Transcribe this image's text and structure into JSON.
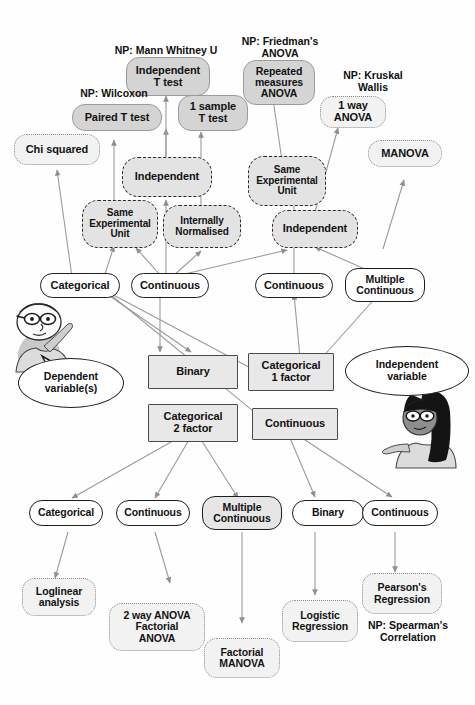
{
  "nodes": {
    "tests_top": [
      {
        "id": "chi-squared",
        "label": "Chi squared"
      },
      {
        "id": "paired-t-test",
        "label": "Paired T test"
      },
      {
        "id": "independent-t-test",
        "label": "Independent\nT test"
      },
      {
        "id": "one-sample-t-test",
        "label": "1 sample\nT test"
      },
      {
        "id": "repeated-measures-anova",
        "label": "Repeated\nmeasures\nANOVA"
      },
      {
        "id": "one-way-anova",
        "label": "1 way\nANOVA"
      },
      {
        "id": "manova",
        "label": "MANOVA"
      }
    ],
    "np_captions": [
      {
        "id": "np-wilcoxon",
        "label": "NP: Wilcoxon"
      },
      {
        "id": "np-mann-whitney",
        "label": "NP: Mann Whitney U"
      },
      {
        "id": "np-friedmans-anova",
        "label": "NP: Friedman's\nANOVA"
      },
      {
        "id": "np-kruskal-wallis",
        "label": "NP: Kruskal\nWallis"
      },
      {
        "id": "np-spearmans-correlation",
        "label": "NP: Spearman's\nCorrelation"
      }
    ],
    "decisions": [
      {
        "id": "decision-independent-left",
        "label": "Independent"
      },
      {
        "id": "decision-same-experimental-unit-left",
        "label": "Same\nExperimental\nUnit"
      },
      {
        "id": "decision-internally-normalised",
        "label": "Internally\nNormalised"
      },
      {
        "id": "decision-same-experimental-unit-right",
        "label": "Same\nExperimental\nUnit"
      },
      {
        "id": "decision-independent-right",
        "label": "Independent"
      }
    ],
    "dependent_row": [
      {
        "id": "dep-categorical",
        "label": "Categorical"
      },
      {
        "id": "dep-continuous-1",
        "label": "Continuous"
      },
      {
        "id": "dep-continuous-2",
        "label": "Continuous"
      },
      {
        "id": "dep-multiple-continuous",
        "label": "Multiple\nContinuous"
      }
    ],
    "independent_boxes": [
      {
        "id": "box-binary",
        "label": "Binary"
      },
      {
        "id": "box-categorical-1-factor",
        "label": "Categorical\n1 factor"
      },
      {
        "id": "box-categorical-2-factor",
        "label": "Categorical\n2 factor"
      },
      {
        "id": "box-continuous",
        "label": "Continuous"
      }
    ],
    "outcome_row": [
      {
        "id": "out-categorical",
        "label": "Categorical"
      },
      {
        "id": "out-continuous-1",
        "label": "Continuous"
      },
      {
        "id": "out-multiple-continuous",
        "label": "Multiple\nContinuous"
      },
      {
        "id": "out-binary",
        "label": "Binary"
      },
      {
        "id": "out-continuous-2",
        "label": "Continuous"
      }
    ],
    "tests_bottom": [
      {
        "id": "loglinear-analysis",
        "label": "Loglinear\nanalysis"
      },
      {
        "id": "two-way-anova",
        "label": "2 way ANOVA\nFactorial\nANOVA"
      },
      {
        "id": "factorial-manova",
        "label": "Factorial\nMANOVA"
      },
      {
        "id": "logistic-regression",
        "label": "Logistic\nRegression"
      },
      {
        "id": "pearsons-regression",
        "label": "Pearson's\nRegression"
      }
    ]
  },
  "bubbles": [
    {
      "id": "bubble-dependent",
      "label": "Dependent\nvariable(s)"
    },
    {
      "id": "bubble-independent",
      "label": "Independent\nvariable"
    }
  ],
  "figures": [
    {
      "id": "figure-man",
      "name": "man-with-glasses"
    },
    {
      "id": "figure-woman",
      "name": "woman-with-long-hair"
    }
  ],
  "colors": {
    "test_fill": "#d4d4d4",
    "decision_fill": "#e3e3e3",
    "box_fill": "#e8e8e8",
    "node_border": "#1d1d1d",
    "edge": "#9a9a9a",
    "background": "#fefefe"
  }
}
